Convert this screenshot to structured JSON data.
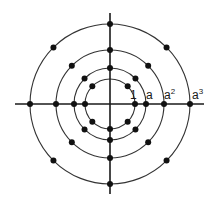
{
  "diagram": {
    "center": {
      "x": 110,
      "y": 104
    },
    "axes": {
      "horizontal": {
        "x1": 15,
        "x2": 204
      },
      "vertical": {
        "y1": 13,
        "y2": 194
      },
      "color": "#1a1a1a"
    },
    "circles": [
      {
        "name": "ring-1",
        "r": 25,
        "dot_angles": [
          0,
          45,
          135,
          180,
          225,
          270,
          315
        ]
      },
      {
        "name": "ring-a",
        "r": 36,
        "dot_angles": [
          0,
          45,
          90,
          135,
          180,
          225,
          270,
          315
        ]
      },
      {
        "name": "ring-a2",
        "r": 54,
        "dot_angles": [
          0,
          45,
          90,
          135,
          180,
          225,
          270,
          315
        ]
      },
      {
        "name": "ring-a3",
        "r": 80,
        "dot_angles": [
          0,
          45,
          90,
          135,
          180,
          225,
          270,
          315
        ]
      }
    ],
    "labels": [
      {
        "id": "one",
        "base": "1",
        "sup": "",
        "x": 130,
        "y": 99
      },
      {
        "id": "a",
        "base": "a",
        "sup": "",
        "x": 146,
        "y": 99
      },
      {
        "id": "a2",
        "base": "a",
        "sup": "2",
        "x": 164,
        "y": 99
      },
      {
        "id": "a3",
        "base": "a",
        "sup": "3",
        "x": 192,
        "y": 99
      }
    ],
    "dot_radius": 3,
    "stroke_color": "#333333",
    "dot_color": "#111111"
  }
}
